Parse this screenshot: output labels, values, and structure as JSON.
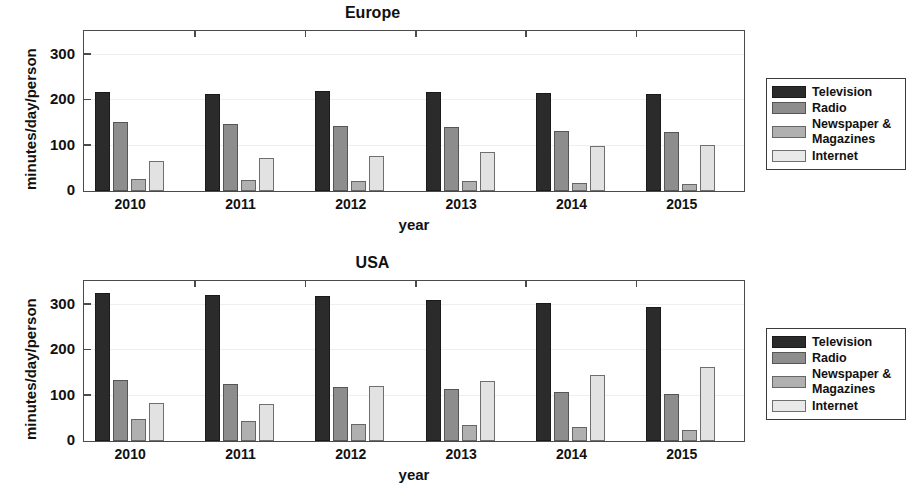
{
  "chart_data": [
    {
      "type": "bar",
      "title": "Europe",
      "xlabel": "year",
      "ylabel": "minutes/day/person",
      "categories": [
        "2010",
        "2011",
        "2012",
        "2013",
        "2014",
        "2015"
      ],
      "yticks": [
        0,
        100,
        200,
        300
      ],
      "ylim": [
        0,
        350
      ],
      "grid": true,
      "legend_position": "right-outside",
      "series": [
        {
          "name": "Television",
          "color": "#2b2b2b",
          "values": [
            218,
            213,
            220,
            218,
            215,
            213
          ]
        },
        {
          "name": "Radio",
          "color": "#8d8d8d",
          "values": [
            152,
            147,
            143,
            140,
            133,
            130
          ]
        },
        {
          "name": "Newspaper & Magazines",
          "color": "#b0b0b0",
          "values": [
            27,
            24,
            22,
            21,
            18,
            16
          ]
        },
        {
          "name": "Internet",
          "color": "#e2e2e2",
          "values": [
            67,
            72,
            78,
            86,
            100,
            102
          ]
        }
      ]
    },
    {
      "type": "bar",
      "title": "USA",
      "xlabel": "year",
      "ylabel": "minutes/day/person",
      "categories": [
        "2010",
        "2011",
        "2012",
        "2013",
        "2014",
        "2015"
      ],
      "yticks": [
        0,
        100,
        200,
        300
      ],
      "ylim": [
        0,
        350
      ],
      "grid": true,
      "legend_position": "right-outside",
      "series": [
        {
          "name": "Television",
          "color": "#2b2b2b",
          "values": [
            325,
            322,
            320,
            311,
            303,
            295
          ]
        },
        {
          "name": "Radio",
          "color": "#8d8d8d",
          "values": [
            135,
            126,
            120,
            115,
            107,
            103
          ]
        },
        {
          "name": "Newspaper & Magazines",
          "color": "#b0b0b0",
          "values": [
            48,
            43,
            38,
            36,
            30,
            25
          ]
        },
        {
          "name": "Internet",
          "color": "#e2e2e2",
          "values": [
            84,
            81,
            121,
            133,
            146,
            162
          ]
        }
      ]
    }
  ],
  "legend": {
    "entries": [
      {
        "label": "Television"
      },
      {
        "label": "Radio"
      },
      {
        "label": "Newspaper &",
        "label2": "Magazines"
      },
      {
        "label": "Internet"
      }
    ]
  }
}
